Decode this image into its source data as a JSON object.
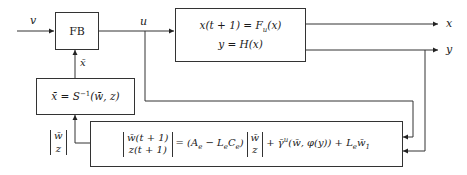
{
  "diagram": {
    "blocks": {
      "feedback": {
        "label": "FB"
      },
      "plant": {
        "line1": "x(t + 1) = F",
        "line1_sub": "u",
        "line1_tail": "(x)",
        "line2": "y = H(x)"
      },
      "inverse": {
        "lhs": "x̄ = S",
        "sup": "−1",
        "rhs": "(w̄, z)"
      },
      "observer": {
        "lhs_top": "w̄(t + 1)",
        "lhs_bottom": "z(t + 1)",
        "mid": "= (A",
        "mid_sub1": "e",
        "mid2": " − L",
        "mid_sub2": "e",
        "mid3": "C",
        "mid_sub3": "e",
        "mid4": ")",
        "vec_top": "w̄",
        "vec_bottom": "z",
        "tail": "+ γ̄",
        "tail_sup": "u",
        "tail2": "(w̄, φ(y)) + L",
        "tail_sub": "e",
        "tail3": "w̄",
        "tail_sub2": "1"
      }
    },
    "signals": {
      "v": "v",
      "u": "u",
      "x": "x",
      "y": "y",
      "xbar": "x̄",
      "state_top": "w̄",
      "state_bottom": "z"
    },
    "colors": {
      "line": "#333333",
      "background": "#ffffff"
    }
  }
}
